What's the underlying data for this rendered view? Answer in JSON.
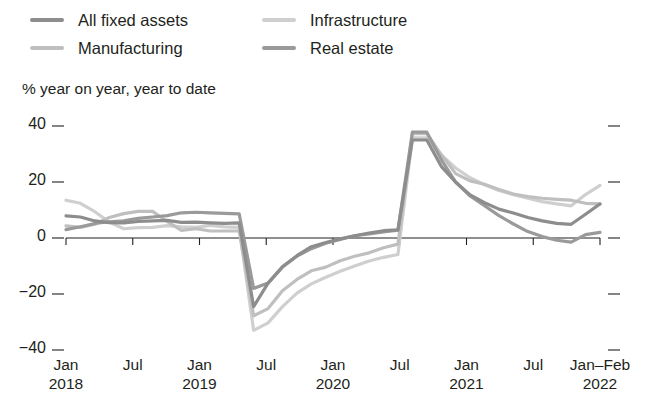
{
  "legend": {
    "items": [
      {
        "label": "All fixed assets",
        "color": "#8d8d8d",
        "key": "all_fixed_assets"
      },
      {
        "label": "Manufacturing",
        "color": "#bfbfbf",
        "key": "manufacturing"
      },
      {
        "label": "Infrastructure",
        "color": "#cfcfcf",
        "key": "infrastructure"
      },
      {
        "label": "Real estate",
        "color": "#9a9a9a",
        "key": "real_estate"
      }
    ]
  },
  "axis": {
    "unit_caption": "% year on year, year to date",
    "y_ticks": [
      "40",
      "20",
      "0",
      "−20",
      "−40"
    ],
    "x_ticks": [
      {
        "line1": "Jan",
        "line2": "2018"
      },
      {
        "line1": "Jul",
        "line2": ""
      },
      {
        "line1": "Jan",
        "line2": "2019"
      },
      {
        "line1": "Jul",
        "line2": ""
      },
      {
        "line1": "Jan",
        "line2": "2020"
      },
      {
        "line1": "Jul",
        "line2": ""
      },
      {
        "line1": "Jan",
        "line2": "2021"
      },
      {
        "line1": "Jul",
        "line2": ""
      },
      {
        "line1": "Jan–Feb",
        "line2": "2022"
      }
    ]
  },
  "chart_data": {
    "type": "line",
    "title": "",
    "xlabel": "",
    "ylabel": "% year on year, year to date",
    "ylim": [
      -40,
      40
    ],
    "yticks": [
      -40,
      -20,
      0,
      20,
      40
    ],
    "grid": false,
    "legend_position": "top",
    "x": [
      "Jan 2018",
      "Mar 2018",
      "May 2018",
      "Jul 2018",
      "Sep 2018",
      "Nov 2018",
      "Jan 2019",
      "Mar 2019",
      "May 2019",
      "Jul 2019",
      "Sep 2019",
      "Nov 2019",
      "Jan 2020",
      "Feb 2020",
      "Mar 2020",
      "Apr 2020",
      "May 2020",
      "Jun 2020",
      "Jul 2020",
      "Aug 2020",
      "Sep 2020",
      "Oct 2020",
      "Nov 2020",
      "Dec 2020",
      "Jan 2021",
      "Feb 2021",
      "Mar 2021",
      "Apr 2021",
      "May 2021",
      "Jun 2021",
      "Jul 2021",
      "Aug 2021",
      "Sep 2021",
      "Oct 2021",
      "Nov 2021",
      "Dec 2021",
      "Jan 2022",
      "Feb 2022"
    ],
    "series": [
      {
        "name": "All fixed assets",
        "color": "#8d8d8d",
        "values": [
          7.9,
          7.5,
          6.1,
          5.5,
          5.4,
          5.9,
          6.1,
          6.3,
          5.6,
          5.7,
          5.4,
          5.2,
          5.4,
          -24.5,
          -16.1,
          -10.3,
          -6.3,
          -3.1,
          -1.6,
          -0.3,
          0.8,
          1.8,
          2.6,
          2.9,
          35.0,
          35.0,
          25.6,
          19.9,
          15.4,
          12.6,
          10.3,
          8.9,
          7.3,
          6.1,
          5.2,
          4.9,
          8.5,
          12.2
        ]
      },
      {
        "name": "Manufacturing",
        "color": "#bfbfbf",
        "values": [
          4.3,
          3.8,
          4.9,
          7.3,
          8.7,
          9.5,
          9.5,
          5.9,
          2.7,
          3.3,
          2.5,
          2.5,
          2.5,
          -27.8,
          -25.2,
          -18.8,
          -14.8,
          -11.7,
          -10.4,
          -8.1,
          -6.5,
          -5.3,
          -3.5,
          -2.2,
          37.3,
          37.3,
          29.8,
          23.0,
          20.4,
          19.2,
          17.3,
          15.7,
          14.8,
          14.2,
          13.8,
          13.5,
          12.4,
          12.2
        ]
      },
      {
        "name": "Infrastructure",
        "color": "#cfcfcf",
        "values": [
          13.5,
          12.4,
          9.4,
          5.7,
          3.3,
          3.7,
          3.8,
          4.4,
          4.0,
          3.8,
          4.5,
          4.0,
          3.8,
          -33.0,
          -30.3,
          -24.5,
          -19.7,
          -16.4,
          -14.0,
          -11.9,
          -10.0,
          -8.2,
          -6.9,
          -5.9,
          35.8,
          35.8,
          29.7,
          25.0,
          21.5,
          19.0,
          17.0,
          15.5,
          14.2,
          13.0,
          12.2,
          11.5,
          15.5,
          18.8
        ]
      },
      {
        "name": "Real estate",
        "color": "#9a9a9a",
        "values": [
          3.0,
          4.0,
          5.2,
          5.8,
          6.1,
          7.0,
          7.5,
          8.0,
          9.0,
          9.2,
          9.0,
          8.8,
          8.6,
          -18.0,
          -16.1,
          -10.3,
          -6.5,
          -3.8,
          -1.9,
          -0.5,
          0.8,
          1.5,
          2.2,
          2.8,
          37.8,
          37.8,
          28.0,
          20.0,
          15.0,
          11.5,
          8.0,
          5.0,
          2.3,
          0.5,
          -0.8,
          -1.5,
          1.2,
          2.0
        ]
      }
    ]
  }
}
